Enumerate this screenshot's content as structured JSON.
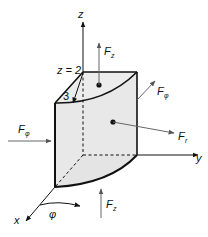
{
  "figure": {
    "colors": {
      "face_fill": "#e8e8e8",
      "edge": "#111111",
      "arrow": "#666666",
      "background": "#ffffff"
    },
    "axes": {
      "z": "z",
      "y": "y",
      "x": "x"
    },
    "labels": {
      "z_eq": "z = 2",
      "radius": "3",
      "phi": "φ"
    },
    "forces": {
      "Fz_top": {
        "main": "F",
        "sub": "z"
      },
      "Fphi_right": {
        "main": "F",
        "sub": "φ"
      },
      "Fphi_left": {
        "main": "F",
        "sub": "φ"
      },
      "Fr": {
        "main": "F",
        "sub": "r"
      },
      "Fz_bottom": {
        "main": "F",
        "sub": "z"
      }
    }
  }
}
